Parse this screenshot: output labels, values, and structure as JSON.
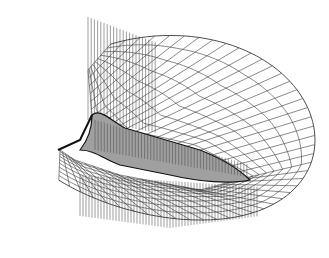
{
  "figure": {
    "colors": {
      "background": "#ffffff",
      "grid_line": "#333333",
      "body_fill": "#9a9a9a",
      "body_edge": "#111111"
    },
    "mesh": {
      "radial_lines": 46,
      "circumferential_lines": 9
    }
  }
}
